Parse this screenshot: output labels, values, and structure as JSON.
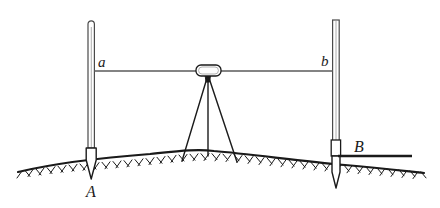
{
  "figure": {
    "kind": "surveying-leveling-diagram",
    "title": "",
    "background_color": "#ffffff",
    "ink_color": "#1a1a1a",
    "width": 440,
    "height": 208
  },
  "labels": {
    "staff_reading_left": "a",
    "staff_reading_right": "b",
    "point_left": "A",
    "point_right": "B"
  },
  "elements": {
    "left_staff_name": "left leveling staff",
    "right_staff_name": "right leveling staff",
    "instrument_name": "automatic level",
    "tripod_name": "tripod",
    "sight_line_name": "line of sight",
    "ground_name": "ground surface",
    "datum_line_name": "reference datum line"
  },
  "geometry": {
    "sight_line_y": 71,
    "left_staff_x": 91,
    "right_staff_x": 336,
    "instrument_center_x": 208,
    "instrument_body": {
      "x": 196,
      "y": 65,
      "w": 25,
      "h": 11
    },
    "tripod_apex": {
      "x": 208,
      "y": 77
    },
    "tripod_feet": [
      182,
      208,
      236
    ],
    "ground_path": "M 18,172 C 60,162 110,157 150,154 C 180,151 196,149 214,151 C 250,154 300,161 345,165 C 380,168 405,171 424,173",
    "datum_line": {
      "x1": 338,
      "y1": 156,
      "x2": 412,
      "y2": 156
    }
  },
  "label_positions": {
    "a": {
      "x": 98,
      "y": 67
    },
    "b": {
      "x": 322,
      "y": 66
    },
    "A": {
      "x": 88,
      "y": 196
    },
    "B": {
      "x": 355,
      "y": 152
    }
  }
}
